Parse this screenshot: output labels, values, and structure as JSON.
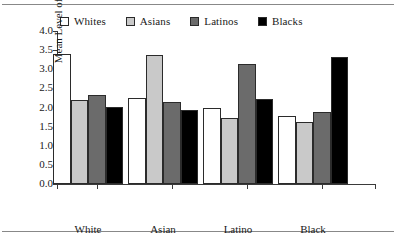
{
  "figure": {
    "ylabel": "Mean Level of Friends"
  },
  "legend": {
    "position": "top",
    "items": [
      {
        "label": "Whites",
        "color": "#ffffff",
        "name": "legend-swatch-whites"
      },
      {
        "label": "Asians",
        "color": "#c9c9c9",
        "name": "legend-swatch-asians"
      },
      {
        "label": "Latinos",
        "color": "#6b6b6b",
        "name": "legend-swatch-latinos"
      },
      {
        "label": "Blacks",
        "color": "#000000",
        "name": "legend-swatch-blacks"
      }
    ]
  },
  "yaxis": {
    "ticks": [
      "0.0",
      "0.5",
      "1.0",
      "1.5",
      "2.0",
      "2.5",
      "3.0",
      "3.5",
      "4.0"
    ]
  },
  "xaxis": {
    "labels": [
      {
        "line1": "White",
        "line2": "Friends"
      },
      {
        "line1": "Asian",
        "line2": "Friends"
      },
      {
        "line1": "Latino",
        "line2": "Friends"
      },
      {
        "line1": "Black",
        "line2": "Friends"
      }
    ]
  },
  "chart_data": {
    "type": "bar",
    "title": "",
    "xlabel": "",
    "ylabel": "Mean Level of Friends",
    "ylim": [
      0.0,
      4.0
    ],
    "ytick_step": 0.5,
    "grid": false,
    "legend_position": "top",
    "categories": [
      "White Friends",
      "Asian Friends",
      "Latino Friends",
      "Black Friends"
    ],
    "series": [
      {
        "name": "Whites",
        "color": "#ffffff",
        "values": [
          3.41,
          2.26,
          1.98,
          1.77
        ]
      },
      {
        "name": "Asians",
        "color": "#c9c9c9",
        "values": [
          2.2,
          3.36,
          1.73,
          1.62
        ]
      },
      {
        "name": "Latinos",
        "color": "#6b6b6b",
        "values": [
          2.34,
          2.14,
          3.14,
          1.88
        ]
      },
      {
        "name": "Blacks",
        "color": "#000000",
        "values": [
          2.02,
          1.93,
          2.23,
          3.31
        ]
      }
    ]
  }
}
